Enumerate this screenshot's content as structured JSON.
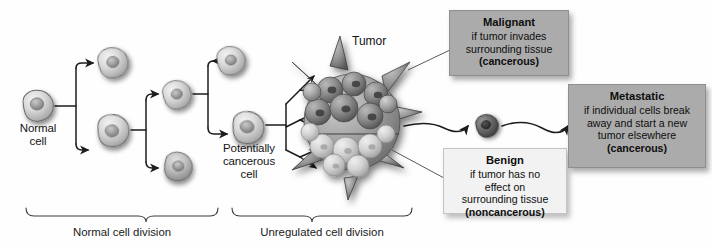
{
  "diagram": {
    "background_color": "#fefefe"
  },
  "cell_labels": {
    "normal": "Normal\ncell",
    "potentially_cancerous": "Potentially\ncancerous\ncell",
    "tumor": "Tumor"
  },
  "stage_braces": [
    {
      "label": "Normal cell division"
    },
    {
      "label": "Unregulated cell division"
    }
  ],
  "callouts": [
    {
      "id": "malignant",
      "heading": "Malignant",
      "body": "if tumor invades\nsurrounding tissue",
      "tail": "(cancerous)",
      "fill": "#ababab",
      "style": "box-gray"
    },
    {
      "id": "benign",
      "heading": "Benign",
      "body": "if tumor has no\neffect on\nsurrounding tissue",
      "tail": "(noncancerous)",
      "fill": "#f2f2f2",
      "style": "box-light"
    },
    {
      "id": "metastatic",
      "heading": "Metastatic",
      "body": "if individual cells break\naway and start a new\ntumor elsewhere",
      "tail": "(cancerous)",
      "fill": "#ababab",
      "style": "box-gray"
    }
  ],
  "colors": {
    "line": "#1c1c1c",
    "cell_fill_light": "#d8d8d8",
    "cell_fill_mid": "#b4b4b4",
    "cell_fill_dark": "#6f6f6f",
    "nucleus": "#8c8c8c",
    "shadow": "#9a9a9a",
    "box_gray": "#ababab",
    "box_light": "#f2f2f2"
  },
  "cells": [
    {
      "name": "normal-cell",
      "cx": 38,
      "cy": 106,
      "r": 15,
      "tone": "light"
    },
    {
      "name": "daughter-cell-upper",
      "cx": 113,
      "cy": 63,
      "r": 15,
      "tone": "light"
    },
    {
      "name": "daughter-cell-lower",
      "cx": 113,
      "cy": 130,
      "r": 16,
      "tone": "light"
    },
    {
      "name": "granddaughter-upper",
      "cx": 177,
      "cy": 96,
      "r": 14,
      "tone": "light"
    },
    {
      "name": "granddaughter-lower",
      "cx": 177,
      "cy": 160,
      "r": 14,
      "tone": "mid"
    },
    {
      "name": "great-granddaughter",
      "cx": 230,
      "cy": 62,
      "r": 14,
      "tone": "light"
    },
    {
      "name": "potentially-cancerous",
      "cx": 248,
      "cy": 125,
      "r": 16,
      "tone": "light"
    },
    {
      "name": "metastatic-cell",
      "cx": 487,
      "cy": 126,
      "r": 11,
      "tone": "dark"
    }
  ],
  "arrow_count_fan": 6
}
